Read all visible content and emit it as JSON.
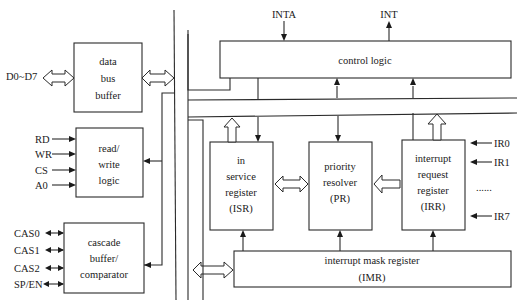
{
  "blocks": {
    "data_bus_buffer": {
      "lines": [
        "data",
        "bus",
        "buffer"
      ]
    },
    "read_write_logic": {
      "lines": [
        "read/",
        "write",
        "logic"
      ]
    },
    "cascade_buffer": {
      "lines": [
        "cascade",
        "buffer/",
        "comparator"
      ]
    },
    "control_logic": {
      "lines": [
        "control logic"
      ]
    },
    "isr": {
      "lines": [
        "in",
        "service",
        "register",
        "(ISR)"
      ]
    },
    "pr": {
      "lines": [
        "priority",
        "resolver",
        "(PR)"
      ]
    },
    "irr": {
      "lines": [
        "interrupt",
        "request",
        "register",
        "(IRR)"
      ]
    },
    "imr": {
      "lines": [
        "interrupt mask register",
        "(IMR)"
      ]
    }
  },
  "signals": {
    "data": "D0~D7",
    "rw": [
      "RD",
      "WR",
      "CS",
      "A0"
    ],
    "cascade": [
      "CAS0",
      "CAS1",
      "CAS2",
      "SP/EN"
    ],
    "inta": "INTA",
    "int": "INT",
    "ir": [
      "IR0",
      "IR1",
      "......",
      "IR7"
    ]
  }
}
